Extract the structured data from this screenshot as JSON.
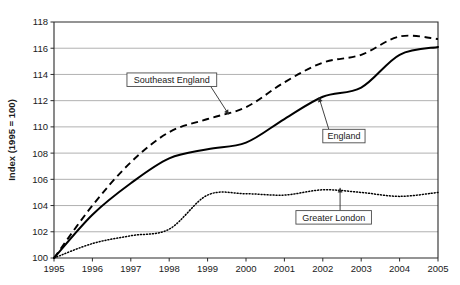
{
  "chart_data": {
    "type": "line",
    "title": "",
    "xlabel": "",
    "ylabel": "Index (1995 = 100)",
    "xlim": [
      1995,
      2005
    ],
    "ylim": [
      100,
      118
    ],
    "yticks": [
      100,
      102,
      104,
      106,
      108,
      110,
      112,
      114,
      116,
      118
    ],
    "grid": true,
    "legend_position": "inline-annotations",
    "x": [
      1995,
      1996,
      1997,
      1998,
      1999,
      2000,
      2001,
      2002,
      2003,
      2004,
      2005
    ],
    "categories": [
      "1995",
      "1996",
      "1997",
      "1998",
      "1999",
      "2000",
      "2001",
      "2002",
      "2003",
      "2004",
      "2005"
    ],
    "series": [
      {
        "name": "Southeast England",
        "style": "dashed",
        "values": [
          100.0,
          104.0,
          107.3,
          109.6,
          110.6,
          111.5,
          113.4,
          114.9,
          115.5,
          116.9,
          116.7
        ]
      },
      {
        "name": "England",
        "style": "solid",
        "values": [
          100.0,
          103.3,
          105.7,
          107.6,
          108.3,
          108.8,
          110.6,
          112.3,
          113.0,
          115.5,
          116.1
        ]
      },
      {
        "name": "Greater London",
        "style": "dotted",
        "values": [
          100.0,
          101.1,
          101.7,
          102.2,
          104.8,
          104.9,
          104.8,
          105.2,
          105.0,
          104.7,
          105.0
        ]
      }
    ],
    "annotations": [
      {
        "label": "Southeast England",
        "point_x": 1999.55,
        "point_y": 110.95,
        "box_x": 1996.9,
        "box_y": 113.6
      },
      {
        "label": "England",
        "point_x": 2001.9,
        "point_y": 112.25,
        "box_x": 2002.0,
        "box_y": 109.3
      },
      {
        "label": "Greater London",
        "point_x": 2002.45,
        "point_y": 105.35,
        "box_x": 2001.3,
        "box_y": 103.1
      }
    ]
  },
  "axis": {
    "y_title": "Index (1995 = 100)",
    "y_tick_labels": [
      "118",
      "116",
      "114",
      "112",
      "110",
      "108",
      "106",
      "104",
      "102",
      "100"
    ],
    "x_tick_labels": [
      "1995",
      "1996",
      "1997",
      "1998",
      "1999",
      "2000",
      "2001",
      "2002",
      "2003",
      "2004",
      "2005"
    ]
  },
  "colors": {
    "ink": "#000000",
    "grid": "#a8a8a8",
    "axis": "#2b2b2b",
    "background": "#ffffff"
  }
}
